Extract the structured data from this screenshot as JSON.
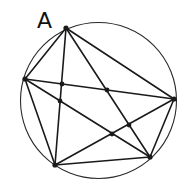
{
  "diagram": {
    "type": "cyclic-pentagon-complete-graph",
    "colors": {
      "stroke": "#1a1a1a",
      "circle": "#2a2a2a",
      "background": "#ffffff"
    },
    "circle": {
      "cx": 98.5,
      "cy": 100.5,
      "r": 78
    },
    "vertices": [
      {
        "id": "A",
        "x": 66,
        "y": 28,
        "label": "A"
      },
      {
        "id": "B",
        "x": 25,
        "y": 79,
        "label": ""
      },
      {
        "id": "C",
        "x": 174,
        "y": 99,
        "label": ""
      },
      {
        "id": "D",
        "x": 150,
        "y": 157,
        "label": ""
      },
      {
        "id": "E",
        "x": 55,
        "y": 165,
        "label": ""
      }
    ],
    "edges": [
      [
        "A",
        "B"
      ],
      [
        "B",
        "E"
      ],
      [
        "E",
        "D"
      ],
      [
        "D",
        "C"
      ],
      [
        "C",
        "A"
      ],
      [
        "A",
        "E"
      ],
      [
        "A",
        "D"
      ],
      [
        "B",
        "C"
      ],
      [
        "B",
        "D"
      ],
      [
        "E",
        "C"
      ]
    ],
    "intersections": [
      {
        "x": 62,
        "y": 84
      },
      {
        "x": 60,
        "y": 101
      },
      {
        "x": 107,
        "y": 90
      },
      {
        "x": 112,
        "y": 134
      },
      {
        "x": 129,
        "y": 125
      }
    ],
    "labels": {
      "vertex_a": "A"
    }
  }
}
